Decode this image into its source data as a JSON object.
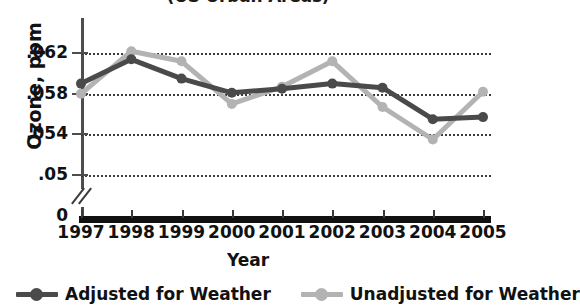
{
  "chart_data": {
    "type": "line",
    "title": "(US Urban Areas)",
    "xlabel": "Year",
    "ylabel": "Ozone, ppm",
    "categories": [
      "1997",
      "1998",
      "1999",
      "2000",
      "2001",
      "2002",
      "2003",
      "2004",
      "2005"
    ],
    "yticks": [
      "0",
      ".05",
      ".054",
      ".058",
      ".062"
    ],
    "ytick_values": [
      0,
      0.05,
      0.054,
      0.058,
      0.062
    ],
    "ylim": [
      0.0495,
      0.0633
    ],
    "y_axis_break": true,
    "grid": "horizontal-dotted",
    "legend_position": "bottom",
    "series": [
      {
        "name": "Adjusted for Weather",
        "color": "#4a4a4a",
        "values": [
          0.059,
          0.0614,
          0.0595,
          0.0581,
          0.0585,
          0.059,
          0.0586,
          0.0555,
          0.0557
        ]
      },
      {
        "name": "Unadjusted for Weather",
        "color": "#b3b3b3",
        "values": [
          0.058,
          0.0622,
          0.0612,
          0.057,
          0.0587,
          0.0612,
          0.0567,
          0.0535,
          0.0582
        ]
      }
    ]
  },
  "legend": {
    "items": [
      {
        "label": "Adjusted for Weather",
        "color": "#4a4a4a"
      },
      {
        "label": "Unadjusted for Weather",
        "color": "#b3b3b3"
      }
    ]
  },
  "colors": {
    "adjusted": "#4a4a4a",
    "unadjusted": "#b3b3b3",
    "axis": "#3a3a3a",
    "grid": "#3b3b3b",
    "text": "#111111"
  }
}
